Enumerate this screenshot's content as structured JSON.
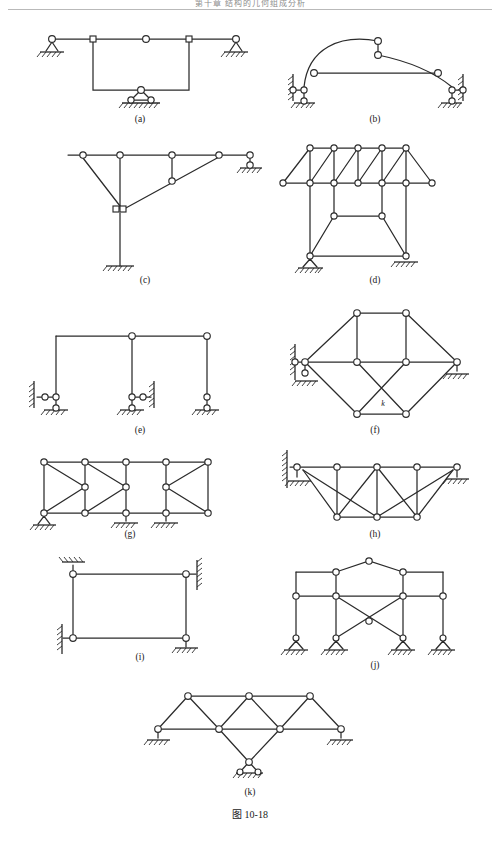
{
  "page": {
    "width": 500,
    "height": 854,
    "background": "#ffffff",
    "line_color": "#2b2b2b",
    "header": {
      "text": "第十章 结构的几何组成分析",
      "rule_color": "#b9b9b9"
    },
    "figure_caption": "图 10-18"
  },
  "figure": {
    "id": "10-18",
    "caption": "图 10-18",
    "panels": [
      {
        "key": "a",
        "label": "(a)",
        "type": "beam-with-hanging-frame",
        "label_x": 140,
        "label_y": 122,
        "nodes": [
          {
            "name": "left-roller-hinge",
            "x": 52,
            "y": 39,
            "shape": "circle"
          },
          {
            "name": "left-square-hinge",
            "x": 93,
            "y": 39,
            "shape": "square"
          },
          {
            "name": "mid-hinge",
            "x": 146,
            "y": 39,
            "shape": "circle"
          },
          {
            "name": "right-square-hinge",
            "x": 189,
            "y": 39,
            "shape": "square"
          },
          {
            "name": "right-roller-hinge",
            "x": 236,
            "y": 39,
            "shape": "circle"
          },
          {
            "name": "apex-hinge-bottom",
            "x": 141,
            "y": 90,
            "shape": "circle"
          },
          {
            "name": "base-left-roller",
            "x": 131,
            "y": 100,
            "shape": "circle"
          },
          {
            "name": "base-right-roller",
            "x": 151,
            "y": 100,
            "shape": "circle"
          }
        ],
        "supports": [
          {
            "name": "left-roller-support",
            "x": 52,
            "y": 39,
            "kind": "roller-under-beam"
          },
          {
            "name": "right-roller-support",
            "x": 236,
            "y": 39,
            "kind": "roller-under-beam"
          },
          {
            "name": "bottom-double-roller-support",
            "x": 141,
            "y": 90,
            "kind": "double-roller"
          }
        ]
      },
      {
        "key": "b",
        "label": "(b)",
        "type": "three-hinged-arch-with-tie",
        "label_x": 375,
        "label_y": 122,
        "nodes": [
          {
            "name": "crown-hinge-upper",
            "x": 378,
            "y": 41,
            "shape": "circle"
          },
          {
            "name": "crown-hinge-lower",
            "x": 378,
            "y": 55,
            "shape": "circle"
          },
          {
            "name": "tie-left-hinge",
            "x": 314,
            "y": 73,
            "shape": "circle"
          },
          {
            "name": "tie-right-hinge",
            "x": 438,
            "y": 73,
            "shape": "circle"
          },
          {
            "name": "left-wall-hinge",
            "x": 293,
            "y": 90,
            "shape": "circle"
          },
          {
            "name": "left-base-hinge",
            "x": 304,
            "y": 90,
            "shape": "circle"
          },
          {
            "name": "left-ground-hinge",
            "x": 304,
            "y": 101,
            "shape": "circle"
          },
          {
            "name": "right-wall-hinge",
            "x": 463,
            "y": 90,
            "shape": "circle"
          },
          {
            "name": "right-base-hinge",
            "x": 452,
            "y": 90,
            "shape": "circle"
          },
          {
            "name": "right-ground-hinge",
            "x": 452,
            "y": 101,
            "shape": "circle"
          }
        ],
        "supports": [
          {
            "name": "left-wall-support",
            "kind": "vertical-wall-hatch"
          },
          {
            "name": "left-ground-support",
            "kind": "ground-hatch"
          },
          {
            "name": "right-wall-support",
            "kind": "vertical-wall-hatch"
          },
          {
            "name": "right-ground-support",
            "kind": "ground-hatch"
          }
        ]
      },
      {
        "key": "c",
        "label": "(c)",
        "type": "cantilever-mast-with-stays",
        "label_x": 145,
        "label_y": 283,
        "nodes": [
          {
            "name": "stay-top-left-hinge",
            "x": 83,
            "y": 155,
            "shape": "circle"
          },
          {
            "name": "mast-top-hinge",
            "x": 120,
            "y": 155,
            "shape": "circle"
          },
          {
            "name": "beam-mid-hinge",
            "x": 172,
            "y": 155,
            "shape": "circle"
          },
          {
            "name": "beam-right-hinge",
            "x": 219,
            "y": 155,
            "shape": "circle"
          },
          {
            "name": "roller-hinge-top",
            "x": 250,
            "y": 155,
            "shape": "circle"
          },
          {
            "name": "roller-hinge-bottom",
            "x": 250,
            "y": 165,
            "shape": "circle"
          },
          {
            "name": "strut-mid-hinge",
            "x": 172,
            "y": 181,
            "shape": "circle"
          },
          {
            "name": "mast-joint-hinge",
            "x": 120,
            "y": 209,
            "shape": "double-square"
          }
        ],
        "supports": [
          {
            "name": "right-roller-support",
            "kind": "roller-on-ground"
          },
          {
            "name": "mast-fixed-base",
            "kind": "fixed-ground-hatch"
          }
        ]
      },
      {
        "key": "d",
        "label": "(d)",
        "type": "pratt-truss-on-trapezoid-substructure",
        "label_x": 375,
        "label_y": 283,
        "nodes_top": [
          {
            "x": 310,
            "y": 148
          },
          {
            "x": 334,
            "y": 148
          },
          {
            "x": 358,
            "y": 148
          },
          {
            "x": 382,
            "y": 148
          },
          {
            "x": 406,
            "y": 148
          }
        ],
        "nodes_bottom": [
          {
            "x": 283,
            "y": 183
          },
          {
            "x": 310,
            "y": 183
          },
          {
            "x": 334,
            "y": 183
          },
          {
            "x": 358,
            "y": 183
          },
          {
            "x": 382,
            "y": 183
          },
          {
            "x": 406,
            "y": 183
          },
          {
            "x": 432,
            "y": 183
          }
        ],
        "sub_nodes": [
          {
            "name": "sub-top-left",
            "x": 334,
            "y": 216
          },
          {
            "name": "sub-top-right",
            "x": 382,
            "y": 216
          },
          {
            "name": "sub-base-left",
            "x": 310,
            "y": 256
          },
          {
            "name": "sub-base-right",
            "x": 406,
            "y": 256
          }
        ],
        "supports": [
          {
            "name": "left-roller-support",
            "kind": "roller-triangle"
          },
          {
            "name": "right-pin-support",
            "kind": "ground-hatch"
          }
        ]
      },
      {
        "key": "e",
        "label": "(e)",
        "type": "three-column-frame",
        "label_x": 140,
        "label_y": 433,
        "nodes": [
          {
            "name": "left-column-top",
            "x": 56,
            "y": 336,
            "shape": "corner"
          },
          {
            "name": "mid-column-top-hinge",
            "x": 132,
            "y": 336,
            "shape": "circle"
          },
          {
            "name": "right-column-top-hinge",
            "x": 207,
            "y": 336,
            "shape": "circle"
          },
          {
            "name": "left-wall-hinge",
            "x": 45,
            "y": 397,
            "shape": "circle"
          },
          {
            "name": "left-base-hinge",
            "x": 56,
            "y": 397,
            "shape": "circle"
          },
          {
            "name": "left-ground-hinge",
            "x": 56,
            "y": 408,
            "shape": "circle"
          },
          {
            "name": "mid-base-hinge",
            "x": 132,
            "y": 397,
            "shape": "circle"
          },
          {
            "name": "mid-wall-hinge",
            "x": 143,
            "y": 397,
            "shape": "circle"
          },
          {
            "name": "mid-ground-hinge",
            "x": 132,
            "y": 408,
            "shape": "circle"
          },
          {
            "name": "right-base-hinge",
            "x": 207,
            "y": 397,
            "shape": "circle"
          },
          {
            "name": "right-ground-hinge",
            "x": 207,
            "y": 408,
            "shape": "circle"
          }
        ],
        "supports": [
          {
            "name": "left-wall-support",
            "kind": "vertical-wall-hatch"
          },
          {
            "name": "mid-wall-support",
            "kind": "vertical-wall-hatch"
          },
          {
            "name": "right-ground-support",
            "kind": "ground-hatch"
          }
        ]
      },
      {
        "key": "f",
        "label": "(f)",
        "type": "hexagonal-truss-with-crossing",
        "label_x": 375,
        "label_y": 433,
        "annotation": {
          "name": "k-label",
          "text": "k",
          "x": 383,
          "y": 405
        },
        "nodes": [
          {
            "name": "top-left",
            "x": 357,
            "y": 313
          },
          {
            "name": "top-right",
            "x": 406,
            "y": 313
          },
          {
            "name": "mid-left-apex",
            "x": 305,
            "y": 362
          },
          {
            "name": "mid-center-left",
            "x": 357,
            "y": 362
          },
          {
            "name": "mid-center-right",
            "x": 406,
            "y": 362
          },
          {
            "name": "mid-right-apex",
            "x": 457,
            "y": 362
          },
          {
            "name": "bottom-left",
            "x": 357,
            "y": 414
          },
          {
            "name": "bottom-right",
            "x": 406,
            "y": 414
          },
          {
            "name": "left-wall-hinge",
            "x": 295,
            "y": 362
          },
          {
            "name": "left-support-lower",
            "x": 305,
            "y": 373
          }
        ],
        "supports": [
          {
            "name": "left-wall-support",
            "kind": "vertical-wall-hatch"
          },
          {
            "name": "left-ground-support",
            "kind": "ground-hatch"
          },
          {
            "name": "right-ground-support",
            "kind": "ground-hatch"
          }
        ]
      },
      {
        "key": "g",
        "label": "(g)",
        "type": "multi-panel-braced-frame",
        "label_x": 130,
        "label_y": 537,
        "grid": {
          "top_y": 462,
          "bottom_y": 513,
          "columns_x": [
            44,
            85,
            126,
            166,
            208
          ],
          "mid_nodes": [
            {
              "x": 85,
              "y": 487
            },
            {
              "x": 126,
              "y": 487
            },
            {
              "x": 166,
              "y": 487
            }
          ]
        },
        "supports": [
          {
            "name": "left-roller-support",
            "kind": "roller-triangle"
          },
          {
            "name": "mid-roller-support",
            "kind": "roller-single"
          },
          {
            "name": "right-roller-support",
            "kind": "roller-single"
          }
        ]
      },
      {
        "key": "h",
        "label": "(h)",
        "type": "cantilever-truss-wall-mounted",
        "label_x": 375,
        "label_y": 537,
        "top_nodes": [
          {
            "x": 297,
            "y": 467
          },
          {
            "x": 337,
            "y": 467
          },
          {
            "x": 377,
            "y": 467
          },
          {
            "x": 417,
            "y": 467
          },
          {
            "x": 457,
            "y": 467
          }
        ],
        "bottom_nodes": [
          {
            "x": 337,
            "y": 517
          },
          {
            "x": 377,
            "y": 517
          },
          {
            "x": 417,
            "y": 517
          }
        ],
        "supports": [
          {
            "name": "left-wall-support",
            "kind": "vertical-wall-hatch"
          },
          {
            "name": "left-ground-support",
            "kind": "ground-hatch"
          },
          {
            "name": "right-ground-support",
            "kind": "ground-hatch"
          }
        ]
      },
      {
        "key": "i",
        "label": "(i)",
        "type": "closed-rectangular-frame",
        "label_x": 140,
        "label_y": 654,
        "corners": [
          {
            "name": "top-left-hinge",
            "x": 73,
            "y": 574
          },
          {
            "name": "top-right-hinge",
            "x": 186,
            "y": 574
          },
          {
            "name": "bottom-left-hinge",
            "x": 73,
            "y": 638
          },
          {
            "name": "bottom-right-hinge",
            "x": 186,
            "y": 638
          }
        ],
        "supports": [
          {
            "name": "top-left-ground-support",
            "kind": "ground-hatch-above"
          },
          {
            "name": "top-right-wall-support",
            "kind": "vertical-wall-hatch"
          },
          {
            "name": "bottom-left-wall-support",
            "kind": "vertical-wall-hatch"
          },
          {
            "name": "bottom-right-ground-support",
            "kind": "ground-hatch"
          }
        ]
      },
      {
        "key": "j",
        "label": "(j)",
        "type": "gabled-frame-with-x-bracing",
        "label_x": 375,
        "label_y": 668,
        "nodes": [
          {
            "name": "ridge-hinge",
            "x": 369,
            "y": 561
          },
          {
            "name": "eave-left-hinge",
            "x": 336,
            "y": 572
          },
          {
            "name": "eave-right-hinge",
            "x": 403,
            "y": 572
          },
          {
            "name": "outer-left-top",
            "x": 296,
            "y": 572
          },
          {
            "name": "outer-right-top",
            "x": 443,
            "y": 572
          },
          {
            "name": "beam-left-end",
            "x": 296,
            "y": 596
          },
          {
            "name": "beam-left-inner",
            "x": 336,
            "y": 596
          },
          {
            "name": "beam-right-inner",
            "x": 403,
            "y": 596
          },
          {
            "name": "beam-right-end",
            "x": 443,
            "y": 596
          },
          {
            "name": "x-center",
            "x": 369,
            "y": 621
          },
          {
            "name": "col1-base",
            "x": 296,
            "y": 641
          },
          {
            "name": "col2-base",
            "x": 336,
            "y": 641
          },
          {
            "name": "col3-base",
            "x": 403,
            "y": 641
          },
          {
            "name": "col4-base",
            "x": 443,
            "y": 641
          }
        ],
        "supports": [
          {
            "name": "support-1",
            "kind": "roller-triangle"
          },
          {
            "name": "support-2",
            "kind": "roller-triangle"
          },
          {
            "name": "support-3",
            "kind": "roller-triangle"
          },
          {
            "name": "support-4",
            "kind": "roller-triangle"
          }
        ]
      },
      {
        "key": "k",
        "label": "(k)",
        "type": "zigzag-truss-with-central-support",
        "label_x": 250,
        "label_y": 795,
        "top_nodes": [
          {
            "x": 188,
            "y": 696
          },
          {
            "x": 249,
            "y": 696
          },
          {
            "x": 310,
            "y": 696
          }
        ],
        "bottom_nodes": [
          {
            "x": 158,
            "y": 729
          },
          {
            "x": 219,
            "y": 729
          },
          {
            "x": 280,
            "y": 729
          },
          {
            "x": 341,
            "y": 729
          }
        ],
        "apex_node": {
          "name": "bottom-apex",
          "x": 249,
          "y": 762
        },
        "supports": [
          {
            "name": "left-ground-support",
            "kind": "ground-hatch"
          },
          {
            "name": "right-ground-support",
            "kind": "ground-hatch"
          },
          {
            "name": "bottom-roller-support",
            "kind": "double-roller"
          }
        ]
      }
    ]
  }
}
